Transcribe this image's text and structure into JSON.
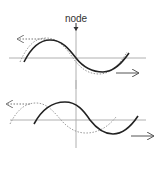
{
  "diagram": {
    "title_label": "node",
    "colors": {
      "background": "#ffffff",
      "axis": "#b0b0b0",
      "solid_wave": "#222222",
      "dotted_wave": "#9a9a9a",
      "arrow": "#555555",
      "label": "#333333"
    },
    "panels": [
      {
        "name": "top",
        "axis_y": 58,
        "axis_x_range": [
          9,
          146
        ],
        "vertical_axis": {
          "x": 76,
          "y_range": [
            30,
            89
          ]
        },
        "solid_wave": {
          "description": "sine wave passing through node at origin",
          "peak": [
            50,
            40
          ],
          "trough": [
            103,
            72
          ]
        },
        "dotted_wave": {
          "description": "nearly in-phase wave slightly shifted left"
        },
        "left_arrow": {
          "style": "dotted",
          "from": [
            45,
            39
          ],
          "to": [
            17,
            39
          ]
        },
        "right_arrow": {
          "style": "solid",
          "from": [
            116,
            73
          ],
          "to": [
            139,
            73
          ]
        }
      },
      {
        "name": "bottom",
        "axis_y": 120,
        "axis_x_range": [
          10,
          146
        ],
        "vertical_axis": {
          "x": 76,
          "y_range": [
            80,
            148
          ]
        },
        "solid_wave": {
          "description": "sine wave shifted right",
          "peak": [
            65,
            102
          ],
          "trough": [
            113,
            134
          ]
        },
        "dotted_wave": {
          "description": "wave shifted left by roughly a quarter period",
          "peak": [
            36,
            103
          ],
          "trough": [
            85,
            133
          ]
        },
        "left_arrow": {
          "style": "dotted",
          "from": [
            30,
            104
          ],
          "to": [
            6,
            104
          ]
        },
        "right_arrow": {
          "style": "solid",
          "from": [
            131,
            136
          ],
          "to": [
            154,
            136
          ]
        }
      }
    ]
  }
}
